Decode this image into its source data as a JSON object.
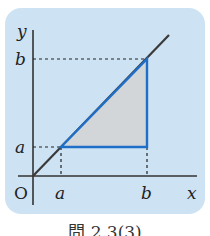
{
  "figure": {
    "axis_labels": {
      "x": "x",
      "y": "y",
      "origin": "O"
    },
    "x_ticks": [
      {
        "label": "a"
      },
      {
        "label": "b"
      }
    ],
    "y_ticks": [
      {
        "label": "b"
      },
      {
        "label": "a"
      }
    ],
    "line": "y = x",
    "shaded_region": "triangle with vertices (a,a), (b,a), (b,b)",
    "colors": {
      "panel_background": "#cde3f4",
      "triangle_fill": "#d3d6d8",
      "triangle_border": "#1f6fc8",
      "line": "#333333"
    }
  },
  "caption": "問 2.3(3)"
}
